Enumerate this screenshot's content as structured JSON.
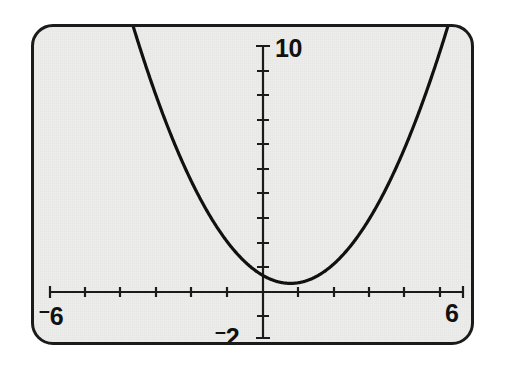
{
  "screen": {
    "device": "graphing-calculator-display",
    "background_color": "#ededeb",
    "border_color": "#1b1b1b",
    "curve_color": "#111111"
  },
  "labels": {
    "x_min": "6",
    "x_min_sign": "–",
    "x_max": "6",
    "y_max": "10",
    "y_min": "2",
    "y_min_sign": "–"
  },
  "chart_data": {
    "type": "line",
    "title": "",
    "xlabel": "",
    "ylabel": "",
    "xlim": [
      -6,
      6
    ],
    "ylim": [
      -2,
      10
    ],
    "grid": false,
    "legend": null,
    "x_tick_step": 1,
    "y_tick_step": 1,
    "x_ticks": [
      -6,
      -5,
      -4,
      -3,
      -2,
      -1,
      0,
      1,
      2,
      3,
      4,
      5,
      6
    ],
    "y_ticks": [
      -2,
      -1,
      0,
      1,
      2,
      3,
      4,
      5,
      6,
      7,
      8,
      9,
      10
    ],
    "x_tick_labels": [
      "-6",
      "",
      "",
      "",
      "",
      "",
      "",
      "",
      "",
      "",
      "",
      "",
      "6"
    ],
    "y_tick_labels": [
      "-2",
      "",
      "",
      "",
      "",
      "",
      "",
      "",
      "",
      "",
      "",
      "",
      "10"
    ],
    "axes_drawn": [
      "x-axis",
      "y-axis"
    ],
    "series": [
      {
        "name": "parabola",
        "color": "#111111",
        "line_width": 3.2,
        "equation": "y = 0.5x^2 - 0.8x + 0.67",
        "vertex": [
          0.8,
          0.35
        ],
        "opens": "up",
        "x": [
          -6.0,
          -5.6,
          -5.2,
          -4.8,
          -4.4,
          -4.0,
          -3.6,
          -3.2,
          -2.8,
          -2.4,
          -2.0,
          -1.6,
          -1.2,
          -0.8,
          -0.4,
          0.0,
          0.4,
          0.8,
          1.2,
          1.6,
          2.0,
          2.4,
          2.8,
          3.2,
          3.6,
          4.0,
          4.4,
          4.8,
          5.2,
          5.6,
          6.0
        ],
        "y": [
          23.47,
          20.83,
          18.39,
          16.03,
          13.87,
          11.87,
          10.03,
          8.35,
          6.83,
          5.47,
          4.27,
          3.23,
          2.35,
          1.63,
          1.07,
          0.67,
          0.43,
          0.35,
          0.43,
          0.67,
          1.07,
          1.63,
          2.35,
          3.23,
          4.27,
          5.47,
          6.83,
          8.35,
          10.03,
          11.87,
          13.87
        ]
      }
    ]
  }
}
